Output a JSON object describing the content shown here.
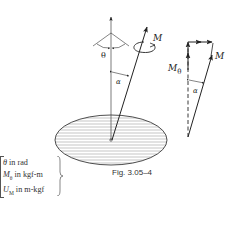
{
  "figure": {
    "caption": "Fig. 3.05–4",
    "labels": {
      "theta": "θ",
      "alpha": "α",
      "moment": "M",
      "moment_theta_main": "M",
      "moment_theta_sub": "θ",
      "alpha_right": "α",
      "moment_right": "M"
    },
    "units": [
      {
        "symbol": "θ",
        "sub": "",
        "text": " in rad"
      },
      {
        "symbol": "M",
        "sub": "θ",
        "text": " in kgf-m"
      },
      {
        "symbol": "U",
        "sub": "M",
        "text": " in m-kgf"
      }
    ],
    "colors": {
      "stroke": "#222222",
      "hatch": "#888888",
      "background": "#ffffff"
    }
  }
}
